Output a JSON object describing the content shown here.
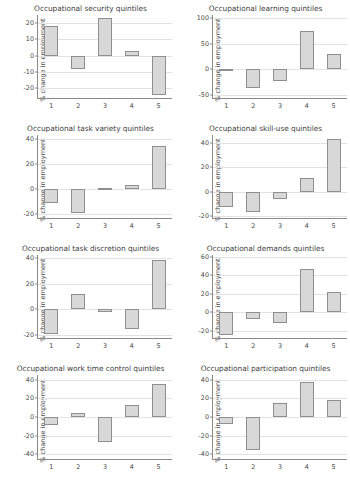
{
  "figure": {
    "axis_label_y": "% change in employment",
    "bar_fill": "#d8d8d8",
    "bar_edge": "#8f8f8f",
    "grid_color": "#e2e2e2",
    "axis_color": "#8a8a8a",
    "background": "#ffffff"
  },
  "chart_data": [
    {
      "type": "bar",
      "title": "Occupational security quintiles",
      "xlabel": "",
      "ylabel": "% change in employment",
      "categories": [
        "1",
        "2",
        "3",
        "4",
        "5"
      ],
      "values": [
        18,
        -8,
        23,
        3,
        -24
      ],
      "yticks": [
        -20,
        -10,
        0,
        10,
        20
      ],
      "ylim": [
        -26,
        25
      ],
      "grid": true,
      "legend": "none"
    },
    {
      "type": "bar",
      "title": "Occupational learning quintiles",
      "xlabel": "",
      "ylabel": "% change in employment",
      "categories": [
        "1",
        "2",
        "3",
        "4",
        "5"
      ],
      "values": [
        -1,
        -36,
        -23,
        75,
        30
      ],
      "yticks": [
        -50,
        0,
        50,
        100
      ],
      "ylim": [
        -55,
        105
      ],
      "grid": true,
      "legend": "none"
    },
    {
      "type": "bar",
      "title": "Occupational task variety quintiles",
      "xlabel": "",
      "ylabel": "% change in employment",
      "categories": [
        "1",
        "2",
        "3",
        "4",
        "5"
      ],
      "values": [
        -11,
        -19,
        1,
        3,
        34
      ],
      "yticks": [
        -20,
        0,
        20,
        40
      ],
      "ylim": [
        -23,
        43
      ],
      "grid": true,
      "legend": "none"
    },
    {
      "type": "bar",
      "title": "Occupational skill-use quintiles",
      "xlabel": "",
      "ylabel": "% change in employment",
      "categories": [
        "1",
        "2",
        "3",
        "4",
        "5"
      ],
      "values": [
        -13,
        -17,
        -6,
        11,
        44
      ],
      "yticks": [
        -20,
        0,
        20,
        40
      ],
      "ylim": [
        -22,
        47
      ],
      "grid": true,
      "legend": "none"
    },
    {
      "type": "bar",
      "title": "Occupational task discretion quintiles",
      "xlabel": "",
      "ylabel": "% change in employment",
      "categories": [
        "1",
        "2",
        "3",
        "4",
        "5"
      ],
      "values": [
        -19,
        12,
        -2,
        -15,
        38
      ],
      "yticks": [
        -20,
        0,
        20,
        40
      ],
      "ylim": [
        -22,
        42
      ],
      "grid": true,
      "legend": "none"
    },
    {
      "type": "bar",
      "title": "Occupational demands quintiles",
      "xlabel": "",
      "ylabel": "% change in employment",
      "categories": [
        "1",
        "2",
        "3",
        "4",
        "5"
      ],
      "values": [
        -25,
        -7,
        -12,
        47,
        22
      ],
      "yticks": [
        -20,
        0,
        20,
        40,
        60
      ],
      "ylim": [
        -28,
        62
      ],
      "grid": true,
      "legend": "none"
    },
    {
      "type": "bar",
      "title": "Occupational work time control quintiles",
      "xlabel": "",
      "ylabel": "% change in employment",
      "categories": [
        "1",
        "2",
        "3",
        "4",
        "5"
      ],
      "values": [
        -9,
        4,
        -27,
        13,
        35
      ],
      "yticks": [
        -40,
        -20,
        0,
        20,
        40
      ],
      "ylim": [
        -45,
        45
      ],
      "grid": true,
      "legend": "none"
    },
    {
      "type": "bar",
      "title": "Occupational participation quintiles",
      "xlabel": "",
      "ylabel": "% change in employment",
      "categories": [
        "1",
        "2",
        "3",
        "4",
        "5"
      ],
      "values": [
        -7,
        -35,
        15,
        37,
        18
      ],
      "yticks": [
        -40,
        -20,
        0,
        20,
        40
      ],
      "ylim": [
        -45,
        45
      ],
      "grid": true,
      "legend": "none"
    }
  ]
}
